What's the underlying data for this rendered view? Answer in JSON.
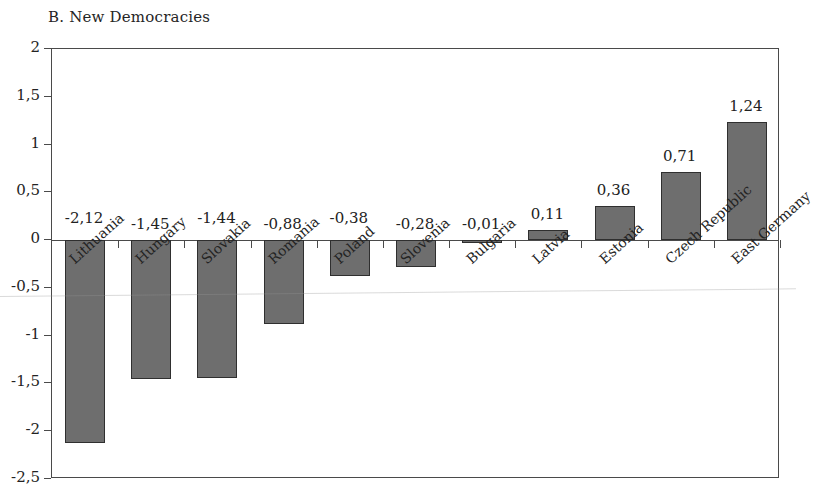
{
  "chart_data": {
    "type": "bar",
    "title": "B. New Democracies",
    "xlabel": "",
    "ylabel": "",
    "ylim": [
      -2.5,
      2
    ],
    "grid": false,
    "legend": null,
    "decimal_separator": ",",
    "categories": [
      "Lithuania",
      "Hungary",
      "Slovakia",
      "Romania",
      "Poland",
      "Slovenia",
      "Bulgaria",
      "Latvia",
      "Estonia",
      "Czech Republic",
      "East Germany"
    ],
    "values": [
      -2.12,
      -1.45,
      -1.44,
      -0.88,
      -0.38,
      -0.28,
      -0.01,
      0.11,
      0.36,
      0.71,
      1.24
    ],
    "value_labels": [
      "-2,12",
      "-1,45",
      "-1,44",
      "-0,88",
      "-0,38",
      "-0,28",
      "-0,01",
      "0,11",
      "0,36",
      "0,71",
      "1,24"
    ],
    "y_ticks": [
      2,
      1.5,
      1,
      0.5,
      0,
      -0.5,
      -1,
      -1.5,
      -2,
      -2.5
    ],
    "y_tick_labels": [
      "2",
      "1,5",
      "1",
      "0,5",
      "0",
      "-0,5",
      "-1",
      "-1,5",
      "-2",
      "-2,5"
    ],
    "bar_color": "#6e6e6e",
    "bar_edge_color": "#2f2f2f",
    "axis_color": "#4a4a4a",
    "background_color": "#ffffff"
  }
}
